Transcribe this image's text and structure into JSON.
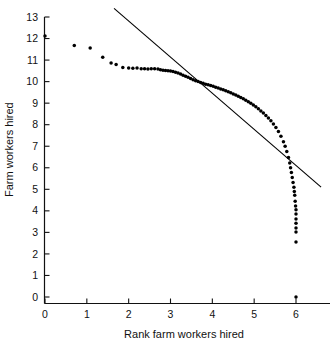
{
  "chart_data": {
    "type": "scatter",
    "title": "",
    "xlabel": "Rank farm workers hired",
    "ylabel": "Farm workers hired",
    "xlim": [
      -0.25,
      6.6
    ],
    "ylim": [
      -0.4,
      13.4
    ],
    "xticks": [
      0,
      1,
      2,
      3,
      4,
      5,
      6
    ],
    "xtick_labels": [
      "0",
      "1",
      "2",
      "3",
      "4",
      "5",
      "6"
    ],
    "yticks": [
      0,
      1,
      2,
      3,
      4,
      5,
      6,
      7,
      8,
      9,
      10,
      11,
      12,
      13
    ],
    "ytick_labels": [
      "0",
      "1",
      "2",
      "3",
      "4",
      "5",
      "6",
      "7",
      "8",
      "9",
      "10",
      "11",
      "12",
      "13"
    ],
    "grid": false,
    "legend": null,
    "marker": "filled-circle",
    "marker_color": "#000000",
    "series": [
      {
        "name": "Farm workers hired vs rank",
        "type": "scatter",
        "points": [
          [
            0.0,
            12.12
          ],
          [
            0.7,
            11.68
          ],
          [
            1.08,
            11.56
          ],
          [
            1.38,
            11.13
          ],
          [
            1.58,
            10.86
          ],
          [
            1.7,
            10.79
          ],
          [
            1.86,
            10.66
          ],
          [
            2.0,
            10.63
          ],
          [
            2.1,
            10.62
          ],
          [
            2.2,
            10.63
          ],
          [
            2.3,
            10.6
          ],
          [
            2.38,
            10.6
          ],
          [
            2.46,
            10.59
          ],
          [
            2.54,
            10.6
          ],
          [
            2.62,
            10.6
          ],
          [
            2.7,
            10.58
          ],
          [
            2.76,
            10.55
          ],
          [
            2.82,
            10.53
          ],
          [
            2.88,
            10.52
          ],
          [
            2.94,
            10.5
          ],
          [
            3.0,
            10.49
          ],
          [
            3.06,
            10.47
          ],
          [
            3.12,
            10.44
          ],
          [
            3.18,
            10.4
          ],
          [
            3.24,
            10.35
          ],
          [
            3.3,
            10.3
          ],
          [
            3.36,
            10.25
          ],
          [
            3.42,
            10.2
          ],
          [
            3.48,
            10.14
          ],
          [
            3.54,
            10.09
          ],
          [
            3.6,
            10.04
          ],
          [
            3.66,
            10.0
          ],
          [
            3.72,
            9.96
          ],
          [
            3.78,
            9.92
          ],
          [
            3.84,
            9.88
          ],
          [
            3.9,
            9.85
          ],
          [
            3.96,
            9.82
          ],
          [
            4.02,
            9.78
          ],
          [
            4.08,
            9.74
          ],
          [
            4.14,
            9.7
          ],
          [
            4.2,
            9.66
          ],
          [
            4.26,
            9.62
          ],
          [
            4.32,
            9.58
          ],
          [
            4.38,
            9.53
          ],
          [
            4.44,
            9.48
          ],
          [
            4.5,
            9.43
          ],
          [
            4.56,
            9.38
          ],
          [
            4.62,
            9.32
          ],
          [
            4.68,
            9.26
          ],
          [
            4.74,
            9.2
          ],
          [
            4.8,
            9.13
          ],
          [
            4.86,
            9.06
          ],
          [
            4.92,
            8.99
          ],
          [
            4.98,
            8.91
          ],
          [
            5.04,
            8.83
          ],
          [
            5.1,
            8.74
          ],
          [
            5.16,
            8.64
          ],
          [
            5.22,
            8.54
          ],
          [
            5.28,
            8.43
          ],
          [
            5.34,
            8.31
          ],
          [
            5.4,
            8.18
          ],
          [
            5.46,
            8.03
          ],
          [
            5.52,
            7.87
          ],
          [
            5.58,
            7.68
          ],
          [
            5.64,
            7.46
          ],
          [
            5.7,
            7.21
          ],
          [
            5.74,
            7.0
          ],
          [
            5.78,
            6.76
          ],
          [
            5.82,
            6.48
          ],
          [
            5.85,
            6.22
          ],
          [
            5.87,
            6.0
          ],
          [
            5.89,
            5.78
          ],
          [
            5.91,
            5.55
          ],
          [
            5.93,
            5.32
          ],
          [
            5.95,
            5.1
          ],
          [
            5.96,
            4.9
          ],
          [
            5.97,
            4.72
          ],
          [
            5.98,
            4.45
          ],
          [
            5.99,
            4.22
          ],
          [
            6.0,
            4.05
          ],
          [
            6.0,
            3.85
          ],
          [
            6.0,
            3.62
          ],
          [
            6.0,
            3.42
          ],
          [
            6.0,
            3.2
          ],
          [
            6.0,
            3.02
          ],
          [
            6.0,
            2.55
          ],
          [
            6.0,
            0.0
          ]
        ]
      }
    ],
    "reference_line": {
      "name": "fitted reference line",
      "style": "solid",
      "color": "#000000",
      "x_start": 1.65,
      "y_start": 13.4,
      "x_end": 6.6,
      "y_end": 5.1
    },
    "annotations": []
  }
}
